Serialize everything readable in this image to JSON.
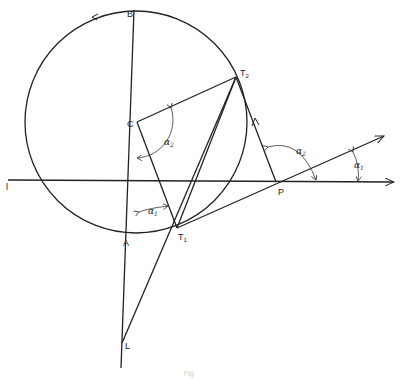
{
  "figure": {
    "points": {
      "B": "B",
      "C": "C",
      "T2": {
        "base": "T",
        "sub": "2"
      },
      "T1": {
        "base": "T",
        "sub": "1"
      },
      "A": "A",
      "L": "L",
      "P": "P",
      "l": "l"
    },
    "angles": {
      "alpha2_center": {
        "base": "α",
        "sub": "2"
      },
      "alpha2_p": {
        "base": "α",
        "sub": "2"
      },
      "alpha1_a": {
        "base": "α",
        "sub": "1"
      },
      "alpha1_right": {
        "base": "α",
        "sub": "1"
      }
    },
    "caption": "Fig."
  }
}
